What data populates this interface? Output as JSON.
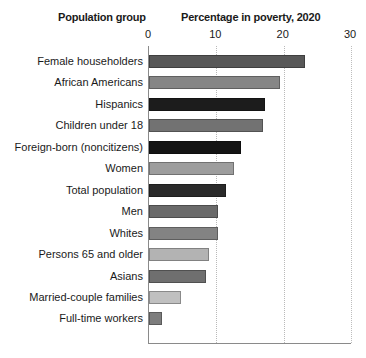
{
  "header": {
    "category_title": "Population group",
    "value_title": "Percentage in poverty, 2020"
  },
  "axis": {
    "ticks": [
      "0",
      "10",
      "20",
      "30"
    ],
    "min": 0,
    "max": 30
  },
  "chart_data": {
    "type": "bar",
    "orientation": "horizontal",
    "title": "Percentage in poverty, 2020",
    "xlabel": "Percentage in poverty, 2020",
    "ylabel": "Population group",
    "xlim": [
      0,
      30
    ],
    "xticks": [
      0,
      10,
      20,
      30
    ],
    "grid": true,
    "legend": "none",
    "categories": [
      "Female householders",
      "African Americans",
      "Hispanics",
      "Children under 18",
      "Foreign-born (noncitizens)",
      "Women",
      "Total population",
      "Men",
      "Whites",
      "Persons 65 and older",
      "Asians",
      "Married-couple families",
      "Full-time workers"
    ],
    "values": [
      23.2,
      19.5,
      17.3,
      16.9,
      13.6,
      12.6,
      11.5,
      10.3,
      10.2,
      8.9,
      8.4,
      4.7,
      1.9
    ],
    "bar_colors": [
      "#585858",
      "#868686",
      "#1c1c1c",
      "#727272",
      "#141414",
      "#9d9d9d",
      "#2a2a2a",
      "#6a6a6a",
      "#838383",
      "#b3b3b3",
      "#6f6f6f",
      "#c0c0c0",
      "#7d7d7d"
    ]
  }
}
